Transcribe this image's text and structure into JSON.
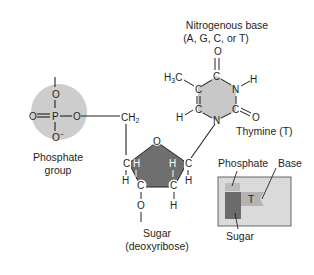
{
  "diagram": {
    "phosphate": {
      "label_line1": "Phosphate",
      "label_line2": "group",
      "atoms": {
        "top": "O",
        "center": "P",
        "left": "O",
        "right": "O",
        "bottom": "O",
        "bottom_charge": "−"
      },
      "color": "#cdcdcd"
    },
    "linker": {
      "ch2": "CH",
      "ch2_sub": "2"
    },
    "sugar": {
      "label_line1": "Sugar",
      "label_line2": "(deoxyribose)",
      "ring_oxygen": "O",
      "carbon": "C",
      "hydrogen": "H",
      "oxygen": "O",
      "color": "#6f6f6f"
    },
    "base": {
      "label_line1": "Nitrogenous base",
      "label_line2": "(A, G, C, or T)",
      "name": "Thymine (T)",
      "carbon": "C",
      "nitrogen": "N",
      "hydrogen": "H",
      "oxygen": "O",
      "methyl": "H",
      "methyl_sub": "3",
      "methyl_c": "C",
      "color": "#c8c8c8"
    },
    "inset": {
      "phosphate_label": "Phosphate",
      "base_label": "Base",
      "sugar_label": "Sugar",
      "base_letter": "T",
      "box_color": "#dadada",
      "sugar_color": "#6b6b6b",
      "phosphate_color": "#bcbcbc",
      "base_color": "#b4b4b4"
    }
  }
}
